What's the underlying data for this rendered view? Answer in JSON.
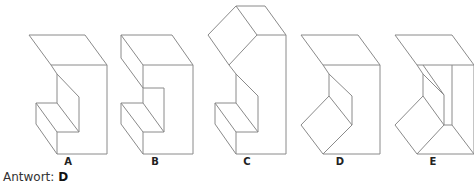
{
  "figures": [
    {
      "id": "A",
      "label": "A"
    },
    {
      "id": "B",
      "label": "B"
    },
    {
      "id": "C",
      "label": "C"
    },
    {
      "id": "D",
      "label": "D"
    },
    {
      "id": "E",
      "label": "E"
    }
  ],
  "answer": {
    "prefix": "Antwort:",
    "value": "D"
  },
  "colors": {
    "line": "#8a8a8a",
    "text": "#222222",
    "background": "#ffffff"
  }
}
